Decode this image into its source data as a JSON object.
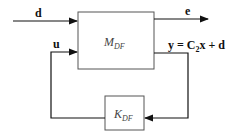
{
  "diagram": {
    "type": "feedback-block-diagram",
    "blocks": [
      {
        "id": "plant",
        "label": "M",
        "subscript": "DF"
      },
      {
        "id": "controller",
        "label": "K",
        "subscript": "DF"
      }
    ],
    "signals": {
      "d": "d",
      "e": "e",
      "u": "u",
      "y": "y = C",
      "y_sub": "2",
      "y_rest": "x + d"
    },
    "colors": {
      "line": "#111111",
      "box": "#333333",
      "background": "#ffffff"
    }
  }
}
